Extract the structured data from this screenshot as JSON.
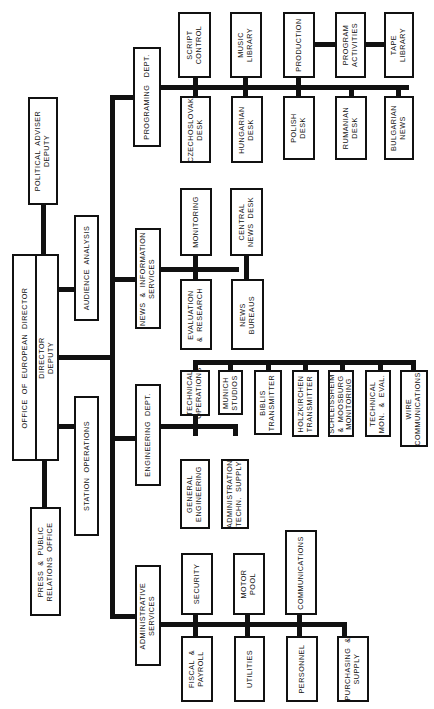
{
  "chart_title": "",
  "root": {
    "director": "OFFICE  OF  EUROPEAN  DIRECTOR",
    "deputy": "DIRECTOR\nDEPUTY"
  },
  "staff": {
    "political_adviser": "POLITICAL  ADVISER\nDEPUTY",
    "press_public_relations": "PRESS  &  PUBLIC\nRELATIONS  OFFICE",
    "audience_analysis": "AUDIENCE  ANALYSIS",
    "station_operations": "STATION  OPERATIONS"
  },
  "departments": {
    "programing": {
      "label": "PROGRAMING   DEPT.",
      "upper": [
        "SCRIPT\nCONTROL",
        "MUSIC\nLIBRARY",
        "PRODUCTION",
        "PROGRAM\nACTIVITIES",
        "TAPE\nLIBRARY"
      ],
      "lower": [
        "CZECHOSLOVAK\nDESK",
        "HUNGARIAN\nDESK",
        "POLISH\nDESK",
        "RUMANIAN\nDESK",
        "BULGARIAN\nNEWS"
      ]
    },
    "news_information": {
      "label": "NEWS  &  INFORMATION\nSERVICES",
      "upper": [
        "MONITORING",
        "CENTRAL\nNEWS  DESK"
      ],
      "lower": [
        "EVALUATION\n&  RESEARCH",
        "NEWS\nBUREAUS"
      ]
    },
    "engineering": {
      "label": "ENGINEERING  DEPT.",
      "technical_operations": "TECHNICAL\nOPERATIONS",
      "tech_ops_children": [
        "MUNICH\nSTUDIOS",
        "BIBLIS\nTRANSMITTER",
        "HOLZKIRCHEN\nTRANSMITTER",
        "SCHLEISSHEIM\n&  MOOSBURG\nMONITORING",
        "TECHNICAL\nMON.  &  EVAL.",
        "WIRE\nCOMMUNICATIONS"
      ],
      "lower": [
        "GENERAL\nENGINEERING",
        "ADMINISTRATION\nTECHN.  SUPPLY"
      ]
    },
    "administrative": {
      "label": "ADMINISTRATIVE\nSERVICES",
      "upper": [
        "SECURITY",
        "MOTOR\nPOOL",
        "COMMUNICATIONS"
      ],
      "lower": [
        "FISCAL  &\nPAYROLL",
        "UTILITIES",
        "PERSONNEL",
        "PURCHASING  &\nSUPPLY"
      ]
    }
  }
}
